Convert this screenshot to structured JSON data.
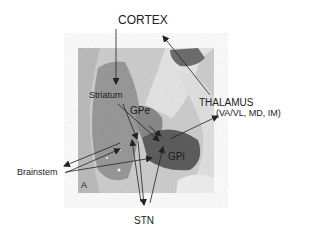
{
  "figure": {
    "panel_letter": "A",
    "labels": {
      "cortex": "CORTEX",
      "striatum": "Striatum",
      "gpe": "GPe",
      "gpi": "GPi",
      "thalamus": "THALAMUS",
      "thalamus_nuclei": "(VA/VL, MD, IM)",
      "brainstem": "Brainstem",
      "stn": "STN"
    },
    "connections": [
      {
        "from": "CORTEX",
        "to": "Striatum"
      },
      {
        "from": "Striatum",
        "to": "GPe"
      },
      {
        "from": "Striatum",
        "to": "GPi"
      },
      {
        "from": "GPe",
        "to": "GPi"
      },
      {
        "from": "GPe",
        "to": "STN"
      },
      {
        "from": "STN",
        "to": "GPe"
      },
      {
        "from": "STN",
        "to": "GPi"
      },
      {
        "from": "GPi",
        "to": "THALAMUS"
      },
      {
        "from": "GPi",
        "to": "Brainstem"
      },
      {
        "from": "THALAMUS",
        "to": "CORTEX"
      }
    ],
    "colors": {
      "background": "#ffffff",
      "arrow": "#222222",
      "text": "#222222"
    }
  }
}
